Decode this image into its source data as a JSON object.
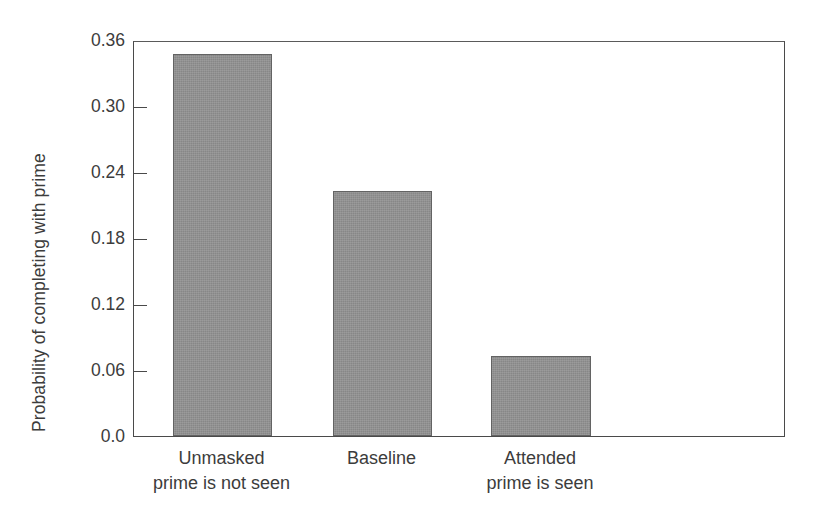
{
  "chart_data": {
    "type": "bar",
    "title": "",
    "xlabel": "",
    "ylabel": "Probability of completing with prime",
    "categories": [
      "Unmasked prime is not seen",
      "Baseline",
      "Attended prime is seen"
    ],
    "category_lines": [
      [
        "Unmasked",
        "prime is not seen"
      ],
      [
        "Baseline",
        ""
      ],
      [
        "Attended",
        "prime is seen"
      ]
    ],
    "values": [
      0.347,
      0.223,
      0.073
    ],
    "ylim": [
      0.0,
      0.36
    ],
    "yticks": [
      0.0,
      0.06,
      0.12,
      0.18,
      0.24,
      0.3,
      0.36
    ],
    "ytick_labels": [
      "0.0",
      "0.06",
      "0.12",
      "0.18",
      "0.24",
      "0.30",
      "0.36"
    ],
    "grid": false,
    "legend": null,
    "bar_color": "#919191",
    "bar_edge_color": "#636363",
    "axis_color": "#4a4a4a",
    "text_color": "#3c3c3c"
  }
}
